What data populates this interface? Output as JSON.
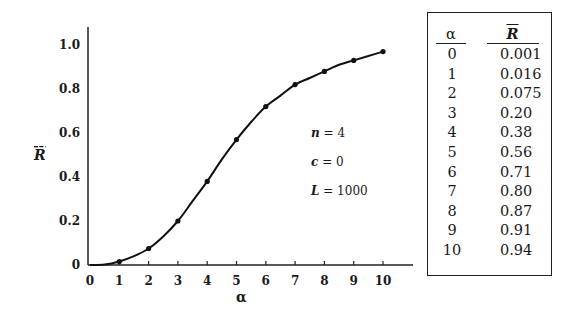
{
  "chart_data": {
    "type": "line",
    "title": "",
    "xlabel": "α",
    "ylabel": "R̄",
    "xlim": [
      0,
      11
    ],
    "ylim": [
      0,
      1.1
    ],
    "x_ticks": [
      "0",
      "1",
      "2",
      "3",
      "4",
      "5",
      "6",
      "7",
      "8",
      "9",
      "10"
    ],
    "y_ticks": [
      "0",
      "0.2",
      "0.4",
      "0.6",
      "0.8",
      "1.0"
    ],
    "grid": false,
    "legend": null,
    "series": [
      {
        "name": "fitted curve",
        "style": "solid line",
        "x": [
          0,
          0.5,
          1,
          1.5,
          2,
          2.5,
          3,
          3.5,
          4,
          4.5,
          5,
          5.5,
          6,
          6.5,
          7,
          7.5,
          8,
          8.5,
          9,
          9.5,
          10
        ],
        "values": [
          0.0,
          0.002,
          0.016,
          0.04,
          0.075,
          0.13,
          0.2,
          0.29,
          0.38,
          0.48,
          0.57,
          0.65,
          0.72,
          0.77,
          0.82,
          0.85,
          0.88,
          0.91,
          0.93,
          0.95,
          0.97
        ]
      },
      {
        "name": "simulated points",
        "style": "dots",
        "x": [
          1,
          2,
          3,
          4,
          5,
          6,
          7,
          8,
          9,
          10
        ],
        "values": [
          0.016,
          0.075,
          0.2,
          0.38,
          0.57,
          0.72,
          0.82,
          0.88,
          0.93,
          0.97
        ]
      }
    ],
    "annotations": [
      {
        "var": "n",
        "text": " = 4"
      },
      {
        "var": "c",
        "text": " = 0"
      },
      {
        "var": "L",
        "text": " = 1000"
      }
    ]
  },
  "table": {
    "headers": {
      "alpha": "α",
      "r": "R"
    },
    "rows": [
      {
        "alpha": "0",
        "r": "0.001"
      },
      {
        "alpha": "1",
        "r": "0.016"
      },
      {
        "alpha": "2",
        "r": "0.075"
      },
      {
        "alpha": "3",
        "r": "0.20"
      },
      {
        "alpha": "4",
        "r": "0.38"
      },
      {
        "alpha": "5",
        "r": "0.56"
      },
      {
        "alpha": "6",
        "r": "0.71"
      },
      {
        "alpha": "7",
        "r": "0.80"
      },
      {
        "alpha": "8",
        "r": "0.87"
      },
      {
        "alpha": "9",
        "r": "0.91"
      },
      {
        "alpha": "10",
        "r": "0.94"
      }
    ]
  },
  "colors": {
    "ink": "#1a1a1a",
    "background": "#ffffff"
  }
}
